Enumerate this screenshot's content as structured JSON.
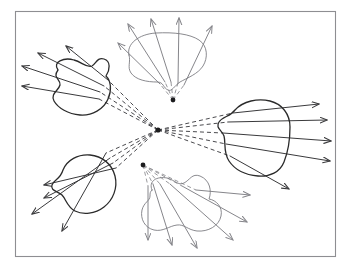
{
  "figure": {
    "canvas": {
      "width": 353,
      "height": 269,
      "background": "#ffffff"
    },
    "frame": {
      "x": 15.5,
      "y": 11.5,
      "width": 320,
      "height": 245,
      "stroke": "#8e8e92",
      "stroke_width": 1.1
    },
    "style": {
      "blob_dark_stroke": "#2b2b2b",
      "blob_light_stroke": "#7d7d82",
      "ray_dark_stroke": "#3a3a3c",
      "ray_light_stroke": "#86868b",
      "dashed_dark_stroke": "#4a4a4e",
      "dashed_light_stroke": "#9a9a9e",
      "blob_stroke_width": 1.3,
      "blob_light_stroke_width": 0.9,
      "ray_stroke_width": 1.0,
      "dash_pattern": "4,3"
    },
    "sources": [
      {
        "name": "central-source",
        "x": 158,
        "y": 130,
        "radius": 2.6,
        "fill": "#1c1c1e"
      },
      {
        "name": "top-middle-source",
        "x": 173,
        "y": 100,
        "radius": 2.4,
        "fill": "#1c1c1e"
      },
      {
        "name": "bottom-middle-source",
        "x": 143,
        "y": 165,
        "radius": 2.4,
        "fill": "#1c1c1e"
      }
    ],
    "blobs": [
      {
        "name": "blob-top-left",
        "tone": "dark",
        "path": "M 58 70 C 52 62 64 57 74 60 C 82 62 86 68 92 66 C 96 64 97 57 104 59 C 111 61 110 70 106 76 C 111 81 112 90 108 99 C 104 109 92 116 80 115 C 68 114 58 108 54 101 C 50 94 59 90 60 85 C 61 79 52 78 58 70 Z"
      },
      {
        "name": "blob-top-middle",
        "tone": "light",
        "path": "M 129 55 C 126 44 139 34 156 33 C 174 32 190 34 199 40 C 208 46 208 58 203 66 C 198 74 187 78 180 82 C 174 86 172 92 168 90 C 163 88 164 82 157 82 C 147 82 136 80 131 73 C 127 67 131 62 129 55 Z"
      },
      {
        "name": "blob-right",
        "tone": "dark",
        "path": "M 235 110 C 243 101 258 98 270 101 C 282 104 290 114 290 127 C 290 140 288 152 284 162 C 280 172 270 177 258 176 C 246 175 235 170 229 161 C 223 152 226 143 224 136 C 222 130 215 128 219 122 C 223 116 230 117 235 110 Z"
      },
      {
        "name": "blob-bottom-left",
        "tone": "dark",
        "path": "M 63 170 C 67 160 78 154 90 155 C 102 156 112 164 115 176 C 118 188 113 200 104 207 C 95 214 83 215 75 211 C 67 207 66 199 62 195 C 58 191 50 191 52 185 C 54 179 60 180 63 170 Z"
      },
      {
        "name": "blob-bottom-middle",
        "tone": "light",
        "path": "M 152 190 C 148 181 157 176 167 178 C 175 180 178 186 184 183 C 190 180 192 173 200 176 C 210 180 212 191 209 199 C 216 200 223 207 221 216 C 219 226 208 232 197 231 C 188 230 184 224 177 225 C 169 226 163 232 154 230 C 145 228 140 219 142 210 C 144 202 150 201 150 196 C 150 193 150 192 152 190 Z"
      }
    ],
    "ray_groups": [
      {
        "name": "rays-top-left",
        "source": "central-source",
        "tone": "dark",
        "rays": [
          {
            "dashed_to": [
              99,
              99
            ],
            "tip": [
              22,
              86
            ]
          },
          {
            "dashed_to": [
              100,
              92
            ],
            "tip": [
              22,
              66
            ]
          },
          {
            "dashed_to": [
              104,
              86
            ],
            "tip": [
              38,
              53
            ]
          },
          {
            "dashed_to": [
              108,
              80
            ],
            "tip": [
              66,
              46
            ]
          }
        ]
      },
      {
        "name": "rays-bottom-left",
        "source": "central-source",
        "tone": "dark",
        "rays": [
          {
            "dashed_to": [
              116,
              168
            ],
            "tip": [
              44,
              185
            ]
          },
          {
            "dashed_to": [
              113,
              163
            ],
            "tip": [
              44,
              198
            ]
          },
          {
            "dashed_to": [
              110,
              158
            ],
            "tip": [
              32,
              214
            ]
          },
          {
            "dashed_to": [
              106,
              153
            ],
            "tip": [
              62,
              231
            ]
          }
        ]
      },
      {
        "name": "rays-right",
        "source": "central-source",
        "tone": "dark",
        "rays": [
          {
            "dashed_to": [
              233,
              113
            ],
            "tip": [
              319,
              104
            ]
          },
          {
            "dashed_to": [
              228,
              122
            ],
            "tip": [
              327,
              120
            ]
          },
          {
            "dashed_to": [
              223,
              133
            ],
            "tip": [
              331,
              141
            ]
          },
          {
            "dashed_to": [
              226,
              144
            ],
            "tip": [
              330,
              161
            ]
          },
          {
            "dashed_to": [
              230,
              156
            ],
            "tip": [
              289,
              189
            ]
          }
        ]
      },
      {
        "name": "rays-top-middle",
        "source": "top-middle-source",
        "tone": "light",
        "rays": [
          {
            "dashed_to": [
              160,
              84
            ],
            "tip": [
              118,
              43
            ]
          },
          {
            "dashed_to": [
              165,
              82
            ],
            "tip": [
              128,
              24
            ]
          },
          {
            "dashed_to": [
              171,
              82
            ],
            "tip": [
              151,
              19
            ]
          },
          {
            "dashed_to": [
              178,
              83
            ],
            "tip": [
              179,
              18
            ]
          },
          {
            "dashed_to": [
              184,
              85
            ],
            "tip": [
              212,
              26
            ]
          }
        ]
      },
      {
        "name": "rays-bottom-middle",
        "source": "bottom-middle-source",
        "tone": "light",
        "rays": [
          {
            "dashed_to": [
              148,
              186
            ],
            "tip": [
              148,
              240
            ]
          },
          {
            "dashed_to": [
              153,
              184
            ],
            "tip": [
              172,
              245
            ]
          },
          {
            "dashed_to": [
              160,
              184
            ],
            "tip": [
              197,
              248
            ]
          },
          {
            "dashed_to": [
              170,
              184
            ],
            "tip": [
              233,
              240
            ]
          },
          {
            "dashed_to": [
              182,
              186
            ],
            "tip": [
              247,
              222
            ]
          },
          {
            "dashed_to": [
              196,
              190
            ],
            "tip": [
              250,
              195
            ]
          }
        ]
      }
    ],
    "counts": {
      "blob_count": 5,
      "source_count": 3,
      "total_rays": 24
    }
  }
}
